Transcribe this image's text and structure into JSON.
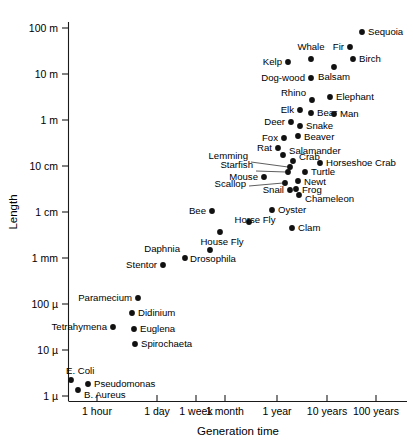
{
  "chart_data": {
    "type": "scatter",
    "title": "",
    "xlabel": "Generation time",
    "ylabel": "Length",
    "grid": false,
    "legend": "none",
    "x_scale": "log",
    "y_scale": "log",
    "x_tick_labels": [
      "1 hour",
      "1 day",
      "1 week",
      "1 month",
      "1 year",
      "10 years",
      "100 years"
    ],
    "x_tick_px": [
      97,
      157,
      196,
      225,
      277,
      327,
      376
    ],
    "y_tick_labels": [
      "100 m",
      "10 m",
      "1 m",
      "10 cm",
      "1 cm",
      "1 mm",
      "100 µ",
      "10 µ",
      "1 µ"
    ],
    "y_tick_px": [
      28,
      74,
      120,
      166,
      212,
      258,
      304,
      350,
      396
    ],
    "y_values": [
      "100 m",
      "10 m",
      "1 m",
      "10 cm",
      "1 cm",
      "1 mm",
      "100 micron",
      "10 micron",
      "1 micron"
    ],
    "points": [
      {
        "label": "Sequoia",
        "px": 362,
        "py": 32,
        "lx": 368,
        "ly": 35,
        "anchor": "l",
        "length": "60 m",
        "generation_time": "60 years"
      },
      {
        "label": "Fir",
        "px": 350,
        "py": 47,
        "lx": 344,
        "ly": 50,
        "anchor": "r",
        "length": "30 m",
        "generation_time": "40 years"
      },
      {
        "label": "Birch",
        "px": 353,
        "py": 59,
        "lx": 359,
        "ly": 62,
        "anchor": "l",
        "length": "20 m",
        "generation_time": "40 years"
      },
      {
        "label": "Whale",
        "px": 311,
        "py": 59,
        "lx": 311,
        "ly": 50,
        "anchor": "c",
        "length": "20 m",
        "generation_time": "8 years"
      },
      {
        "label": "Kelp",
        "px": 288,
        "py": 62,
        "lx": 282,
        "ly": 65,
        "anchor": "r",
        "length": "18 m",
        "generation_time": "5 years"
      },
      {
        "label": "Balsam",
        "px": 334,
        "py": 67,
        "lx": 334,
        "ly": 80,
        "anchor": "c",
        "length": "15 m",
        "generation_time": "20 years"
      },
      {
        "label": "Dog-wood",
        "px": 311,
        "py": 78,
        "lx": 305,
        "ly": 81,
        "anchor": "r",
        "length": "10 m",
        "generation_time": "8 years"
      },
      {
        "label": "Rhino",
        "px": 312,
        "py": 100,
        "lx": 306,
        "ly": 96,
        "anchor": "r",
        "length": "4 m",
        "generation_time": "8 years"
      },
      {
        "label": "Elephant",
        "px": 330,
        "py": 97,
        "lx": 336,
        "ly": 100,
        "anchor": "l",
        "length": "4 m",
        "generation_time": "15 years"
      },
      {
        "label": "Elk",
        "px": 300,
        "py": 110,
        "lx": 294,
        "ly": 113,
        "anchor": "r",
        "length": "2.5 m",
        "generation_time": "6 years"
      },
      {
        "label": "Bear",
        "px": 311,
        "py": 113,
        "lx": 317,
        "ly": 116,
        "anchor": "l",
        "length": "2 m",
        "generation_time": "8 years"
      },
      {
        "label": "Man",
        "px": 334,
        "py": 114,
        "lx": 340,
        "ly": 117,
        "anchor": "l",
        "length": "2 m",
        "generation_time": "18 years"
      },
      {
        "label": "Deer",
        "px": 291,
        "py": 122,
        "lx": 285,
        "ly": 125,
        "anchor": "r",
        "length": "1.5 m",
        "generation_time": "4 years"
      },
      {
        "label": "Snake",
        "px": 300,
        "py": 126,
        "lx": 306,
        "ly": 129,
        "anchor": "l",
        "length": "1.3 m",
        "generation_time": "6 years"
      },
      {
        "label": "Beaver",
        "px": 298,
        "py": 136,
        "lx": 304,
        "ly": 140,
        "anchor": "l",
        "length": "1 m",
        "generation_time": "5 years"
      },
      {
        "label": "Fox",
        "px": 284,
        "py": 138,
        "lx": 278,
        "ly": 141,
        "anchor": "r",
        "length": "1 m",
        "generation_time": "3 years"
      },
      {
        "label": "Rat",
        "px": 278,
        "py": 148,
        "lx": 272,
        "ly": 151,
        "anchor": "r",
        "length": "40 cm",
        "generation_time": "2 years"
      },
      {
        "label": "Salamander",
        "px": 283,
        "py": 155,
        "lx": 289,
        "ly": 154,
        "anchor": "l",
        "length": "30 cm",
        "generation_time": "2.5 years"
      },
      {
        "label": "Crab",
        "px": 293,
        "py": 161,
        "lx": 299,
        "ly": 160,
        "anchor": "l",
        "length": "25 cm",
        "generation_time": "3 years"
      },
      {
        "label": "Horseshoe Crab",
        "px": 320,
        "py": 163,
        "lx": 326,
        "ly": 166,
        "anchor": "l",
        "length": "25 cm",
        "generation_time": "10 years"
      },
      {
        "label": "Lemming",
        "px": 290,
        "py": 167,
        "lx": 248,
        "ly": 159,
        "anchor": "r",
        "length": "20 cm",
        "generation_time": "2.5 years"
      },
      {
        "label": "Starfish",
        "px": 288,
        "py": 172,
        "lx": 253,
        "ly": 168,
        "anchor": "r",
        "length": "18 cm",
        "generation_time": "2.5 years"
      },
      {
        "label": "Turtle",
        "px": 305,
        "py": 172,
        "lx": 311,
        "ly": 175,
        "anchor": "l",
        "length": "18 cm",
        "generation_time": "5 years"
      },
      {
        "label": "Mouse",
        "px": 264,
        "py": 177,
        "lx": 258,
        "ly": 180,
        "anchor": "r",
        "length": "15 cm",
        "generation_time": "1.5 years"
      },
      {
        "label": "Newt",
        "px": 298,
        "py": 181,
        "lx": 304,
        "ly": 185,
        "anchor": "l",
        "length": "12 cm",
        "generation_time": "3.5 years"
      },
      {
        "label": "Scallop",
        "px": 285,
        "py": 183,
        "lx": 246,
        "ly": 187,
        "anchor": "r",
        "length": "12 cm",
        "generation_time": "2.5 years"
      },
      {
        "label": "Snail",
        "px": 290,
        "py": 190,
        "lx": 284,
        "ly": 193,
        "anchor": "r",
        "length": "10 cm",
        "generation_time": "2.5 years"
      },
      {
        "label": "Frog",
        "px": 296,
        "py": 189,
        "lx": 302,
        "ly": 193,
        "anchor": "l",
        "length": "10 cm",
        "generation_time": "3 years"
      },
      {
        "label": "Chameleon",
        "px": 299,
        "py": 195,
        "lx": 305,
        "ly": 202,
        "anchor": "l",
        "length": "9 cm",
        "generation_time": "3 years"
      },
      {
        "label": "Oyster",
        "px": 272,
        "py": 210,
        "lx": 278,
        "ly": 213,
        "anchor": "l",
        "length": "6 cm",
        "generation_time": "1.7 years"
      },
      {
        "label": "Bee",
        "px": 212,
        "py": 211,
        "lx": 206,
        "ly": 214,
        "anchor": "r",
        "length": "1.5 cm",
        "generation_time": "2 months"
      },
      {
        "label": "Horse Fly",
        "px": 249,
        "py": 222,
        "lx": 255,
        "ly": 223,
        "anchor": "c",
        "length": "1.3 cm",
        "generation_time": "8 months"
      },
      {
        "label": "Clam",
        "px": 292,
        "py": 228,
        "lx": 298,
        "ly": 231,
        "anchor": "l",
        "length": "5 cm",
        "generation_time": "2.5 years"
      },
      {
        "label": "House Fly",
        "px": 220,
        "py": 232,
        "lx": 222,
        "ly": 245,
        "anchor": "c",
        "length": "8 mm",
        "generation_time": "3 months"
      },
      {
        "label": "Drosophila",
        "px": 210,
        "py": 250,
        "lx": 213,
        "ly": 262,
        "anchor": "c",
        "length": "3 mm",
        "generation_time": "2 months"
      },
      {
        "label": "Daphnia",
        "px": 185,
        "py": 258,
        "lx": 180,
        "ly": 252,
        "anchor": "r",
        "length": "2 mm",
        "generation_time": "3 weeks"
      },
      {
        "label": "Stentor",
        "px": 163,
        "py": 265,
        "lx": 157,
        "ly": 268,
        "anchor": "r",
        "length": "1.5 mm",
        "generation_time": "1 day"
      },
      {
        "label": "Paramecium",
        "px": 138,
        "py": 298,
        "lx": 132,
        "ly": 301,
        "anchor": "r",
        "length": "200 µ",
        "generation_time": "10 hours"
      },
      {
        "label": "Didinium",
        "px": 132,
        "py": 313,
        "lx": 138,
        "ly": 316,
        "anchor": "l",
        "length": "130 µ",
        "generation_time": "8 hours"
      },
      {
        "label": "Tetrahymena",
        "px": 113,
        "py": 327,
        "lx": 107,
        "ly": 330,
        "anchor": "r",
        "length": "60 µ",
        "generation_time": "3 hours"
      },
      {
        "label": "Euglena",
        "px": 134,
        "py": 329,
        "lx": 140,
        "ly": 332,
        "anchor": "l",
        "length": "55 µ",
        "generation_time": "8 hours"
      },
      {
        "label": "Spirochaeta",
        "px": 135,
        "py": 344,
        "lx": 141,
        "ly": 347,
        "anchor": "l",
        "length": "30 µ",
        "generation_time": "8 hours"
      },
      {
        "label": "E. Coli",
        "px": 71,
        "py": 380,
        "lx": 66,
        "ly": 374,
        "anchor": "l",
        "length": "3 µ",
        "generation_time": "25 minutes"
      },
      {
        "label": "Pseudomonas",
        "px": 88,
        "py": 384,
        "lx": 94,
        "ly": 387,
        "anchor": "l",
        "length": "2.5 µ",
        "generation_time": "40 minutes"
      },
      {
        "label": "B. Aureus",
        "px": 78,
        "py": 390,
        "lx": 84,
        "ly": 398,
        "anchor": "l",
        "length": "2 µ",
        "generation_time": "30 minutes"
      }
    ],
    "leaders": [
      {
        "from_label": "Lemming",
        "x1": 251,
        "y1": 162,
        "x2": 288,
        "y2": 167
      },
      {
        "from_label": "Starfish",
        "x1": 256,
        "y1": 171,
        "x2": 286,
        "y2": 172
      },
      {
        "from_label": "Scallop",
        "x1": 249,
        "y1": 186,
        "x2": 283,
        "y2": 183
      }
    ]
  },
  "axes": {
    "y_axis_title": "Length",
    "x_axis_title": "Generation time"
  }
}
